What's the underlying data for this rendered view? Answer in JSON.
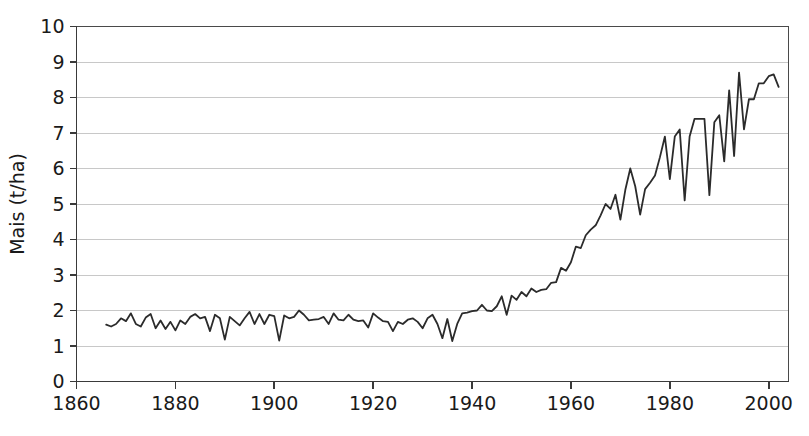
{
  "chart_data": {
    "type": "line",
    "title": "",
    "subtitle": "",
    "xlabel": "",
    "ylabel": "Mais (t/ha)",
    "xlim": [
      1860,
      2004
    ],
    "ylim": [
      0,
      10
    ],
    "grid": true,
    "legend": null,
    "x_ticks": [
      1860,
      1880,
      1900,
      1920,
      1940,
      1960,
      1980,
      2000
    ],
    "x_tick_labels": [
      "1860",
      "1880",
      "1900",
      "1920",
      "1940",
      "1960",
      "1980",
      "2000"
    ],
    "y_ticks": [
      0,
      1,
      2,
      3,
      4,
      5,
      6,
      7,
      8,
      9,
      10
    ],
    "y_tick_labels": [
      "0",
      "1",
      "2",
      "3",
      "4",
      "5",
      "6",
      "7",
      "8",
      "9",
      "10"
    ],
    "line_color": "#2b2b2b",
    "grid_color": "#c8c8c8",
    "axis_color": "#3a3a3a",
    "series": [
      {
        "name": "Mais",
        "x": [
          1866,
          1867,
          1868,
          1869,
          1870,
          1871,
          1872,
          1873,
          1874,
          1875,
          1876,
          1877,
          1878,
          1879,
          1880,
          1881,
          1882,
          1883,
          1884,
          1885,
          1886,
          1887,
          1888,
          1889,
          1890,
          1891,
          1892,
          1893,
          1894,
          1895,
          1896,
          1897,
          1898,
          1899,
          1900,
          1901,
          1902,
          1903,
          1904,
          1905,
          1906,
          1907,
          1908,
          1909,
          1910,
          1911,
          1912,
          1913,
          1914,
          1915,
          1916,
          1917,
          1918,
          1919,
          1920,
          1921,
          1922,
          1923,
          1924,
          1925,
          1926,
          1927,
          1928,
          1929,
          1930,
          1931,
          1932,
          1933,
          1934,
          1935,
          1936,
          1937,
          1938,
          1939,
          1940,
          1941,
          1942,
          1943,
          1944,
          1945,
          1946,
          1947,
          1948,
          1949,
          1950,
          1951,
          1952,
          1953,
          1954,
          1955,
          1956,
          1957,
          1958,
          1959,
          1960,
          1961,
          1962,
          1963,
          1964,
          1965,
          1966,
          1967,
          1968,
          1969,
          1970,
          1971,
          1972,
          1973,
          1974,
          1975,
          1976,
          1977,
          1978,
          1979,
          1980,
          1981,
          1982,
          1983,
          1984,
          1985,
          1986,
          1987,
          1988,
          1989,
          1990,
          1991,
          1992,
          1993,
          1994,
          1995,
          1996,
          1997,
          1998,
          1999,
          2000,
          2001,
          2002
        ],
        "values": [
          1.6,
          1.55,
          1.62,
          1.78,
          1.7,
          1.92,
          1.62,
          1.55,
          1.8,
          1.9,
          1.5,
          1.72,
          1.48,
          1.68,
          1.44,
          1.72,
          1.62,
          1.82,
          1.9,
          1.78,
          1.82,
          1.42,
          1.88,
          1.78,
          1.18,
          1.82,
          1.7,
          1.58,
          1.78,
          1.96,
          1.62,
          1.9,
          1.62,
          1.88,
          1.84,
          1.15,
          1.86,
          1.78,
          1.82,
          2.0,
          1.88,
          1.72,
          1.74,
          1.76,
          1.82,
          1.62,
          1.92,
          1.74,
          1.72,
          1.88,
          1.74,
          1.7,
          1.72,
          1.52,
          1.92,
          1.8,
          1.7,
          1.68,
          1.42,
          1.68,
          1.62,
          1.74,
          1.78,
          1.68,
          1.5,
          1.78,
          1.88,
          1.62,
          1.22,
          1.76,
          1.14,
          1.62,
          1.92,
          1.94,
          1.98,
          2.0,
          2.16,
          2.0,
          1.98,
          2.12,
          2.4,
          1.88,
          2.42,
          2.3,
          2.52,
          2.4,
          2.62,
          2.52,
          2.58,
          2.6,
          2.78,
          2.8,
          3.2,
          3.12,
          3.36,
          3.8,
          3.76,
          4.12,
          4.28,
          4.4,
          4.68,
          5.0,
          4.86,
          5.26,
          4.56,
          5.4,
          6.0,
          5.5,
          4.7,
          5.42,
          5.6,
          5.8,
          6.32,
          6.9,
          5.7,
          6.9,
          7.1,
          5.1,
          6.9,
          7.4,
          7.4,
          7.4,
          5.25,
          7.3,
          7.5,
          6.2,
          8.2,
          6.35,
          8.7,
          7.1,
          7.95,
          7.95,
          8.4,
          8.4,
          8.6,
          8.65,
          8.3
        ]
      }
    ]
  }
}
